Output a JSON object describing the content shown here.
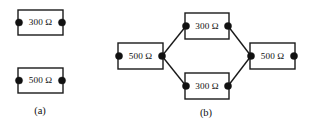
{
  "figure": {
    "background_color": "#ffffff",
    "line_color": "#1a1a1a",
    "terminal_color": "#111111",
    "width": 309,
    "height": 125
  },
  "panels": [
    {
      "id": "a",
      "caption": "(a)",
      "caption_x": 40,
      "caption_y": 112,
      "components": [
        {
          "name": "resistor-300-ohm-a",
          "label": "300 Ω",
          "value": 300,
          "unit": "Ω",
          "box": {
            "x": 18,
            "y": 10,
            "w": 45,
            "h": 25
          },
          "terminals": [
            {
              "name": "left",
              "cx": 19,
              "cy": 22.5,
              "r": 3.6
            },
            {
              "name": "right",
              "cx": 62,
              "cy": 22.5,
              "r": 3.6
            }
          ]
        },
        {
          "name": "resistor-500-ohm-a",
          "label": "500 Ω",
          "value": 500,
          "unit": "Ω",
          "box": {
            "x": 18,
            "y": 68,
            "w": 45,
            "h": 25
          },
          "terminals": [
            {
              "name": "left",
              "cx": 19,
              "cy": 80.5,
              "r": 3.6
            },
            {
              "name": "right",
              "cx": 62,
              "cy": 80.5,
              "r": 3.6
            }
          ]
        }
      ],
      "connections": []
    },
    {
      "id": "b",
      "caption": "(b)",
      "caption_x": 206,
      "caption_y": 114,
      "components": [
        {
          "name": "resistor-500-ohm-b-left",
          "label": "500 Ω",
          "value": 500,
          "unit": "Ω",
          "box": {
            "x": 118,
            "y": 43,
            "w": 45,
            "h": 26
          },
          "terminals": [
            {
              "name": "left",
              "cx": 119,
              "cy": 56,
              "r": 3.6
            },
            {
              "name": "right",
              "cx": 162,
              "cy": 56,
              "r": 3.6
            }
          ]
        },
        {
          "name": "resistor-300-ohm-b-top",
          "label": "300 Ω",
          "value": 300,
          "unit": "Ω",
          "box": {
            "x": 185,
            "y": 13,
            "w": 44,
            "h": 26
          },
          "terminals": [
            {
              "name": "left",
              "cx": 186,
              "cy": 26,
              "r": 3.6
            },
            {
              "name": "right",
              "cx": 228,
              "cy": 26,
              "r": 3.6
            }
          ]
        },
        {
          "name": "resistor-300-ohm-b-bottom",
          "label": "300 Ω",
          "value": 300,
          "unit": "Ω",
          "box": {
            "x": 185,
            "y": 73,
            "w": 44,
            "h": 26
          },
          "terminals": [
            {
              "name": "left",
              "cx": 186,
              "cy": 86,
              "r": 3.6
            },
            {
              "name": "right",
              "cx": 228,
              "cy": 86,
              "r": 3.6
            }
          ]
        },
        {
          "name": "resistor-500-ohm-b-right",
          "label": "500 Ω",
          "value": 500,
          "unit": "Ω",
          "box": {
            "x": 250,
            "y": 43,
            "w": 45,
            "h": 26
          },
          "terminals": [
            {
              "name": "left",
              "cx": 251,
              "cy": 56,
              "r": 3.6
            },
            {
              "name": "right",
              "cx": 294,
              "cy": 56,
              "r": 3.6
            }
          ]
        }
      ],
      "connections": [
        {
          "name": "wire-left500-to-top300",
          "x1": 162,
          "y1": 56,
          "x2": 186,
          "y2": 26
        },
        {
          "name": "wire-left500-to-bottom300",
          "x1": 162,
          "y1": 56,
          "x2": 186,
          "y2": 86
        },
        {
          "name": "wire-top300-to-right500",
          "x1": 228,
          "y1": 26,
          "x2": 251,
          "y2": 56
        },
        {
          "name": "wire-bottom300-to-right500",
          "x1": 228,
          "y1": 86,
          "x2": 251,
          "y2": 56
        }
      ]
    }
  ]
}
